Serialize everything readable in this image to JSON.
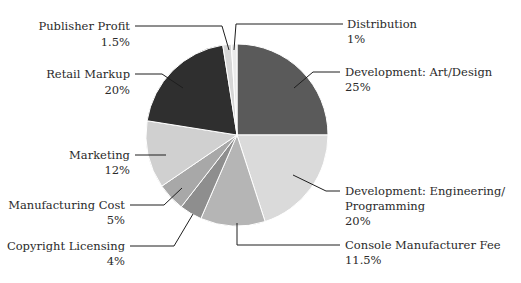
{
  "chart_data": {
    "type": "pie",
    "title": "",
    "start_angle_deg": 0,
    "direction": "clockwise",
    "slices": [
      {
        "label": "Development: Art/Design",
        "value": 25,
        "value_label": "25%",
        "color": "#5a5a5a"
      },
      {
        "label": "Development: Engineering/ Programming",
        "value": 20,
        "value_label": "20%",
        "color": "#dadada"
      },
      {
        "label": "Console Manufacturer Fee",
        "value": 11.5,
        "value_label": "11.5%",
        "color": "#b5b5b5"
      },
      {
        "label": "Copyright Licensing",
        "value": 4,
        "value_label": "4%",
        "color": "#8e8e8e"
      },
      {
        "label": "Manufacturing Cost",
        "value": 5,
        "value_label": "5%",
        "color": "#a8a8a8"
      },
      {
        "label": "Marketing",
        "value": 12,
        "value_label": "12%",
        "color": "#d0d0d0"
      },
      {
        "label": "Retail Markup",
        "value": 20,
        "value_label": "20%",
        "color": "#2f2f2f"
      },
      {
        "label": "Publisher Profit",
        "value": 1.5,
        "value_label": "1.5%",
        "color": "#d6d6d6"
      },
      {
        "label": "Distribution",
        "value": 1,
        "value_label": "1%",
        "color": "#ebebeb"
      }
    ],
    "legend": "none (leader-line callouts)"
  },
  "labels": {
    "publisher_profit": {
      "name": "Publisher Profit",
      "pct": "1.5%"
    },
    "retail_markup": {
      "name": "Retail Markup",
      "pct": "20%"
    },
    "marketing": {
      "name": "Marketing",
      "pct": "12%"
    },
    "manufacturing": {
      "name": "Manufacturing Cost",
      "pct": "5%"
    },
    "copyright": {
      "name": "Copyright Licensing",
      "pct": "4%"
    },
    "distribution": {
      "name": "Distribution",
      "pct": "1%"
    },
    "dev_art": {
      "name": "Development: Art/Design",
      "pct": "25%"
    },
    "dev_eng": {
      "name1": "Development: Engineering/",
      "name2": "Programming",
      "pct": "20%"
    },
    "console_fee": {
      "name": "Console Manufacturer Fee",
      "pct": "11.5%"
    }
  }
}
